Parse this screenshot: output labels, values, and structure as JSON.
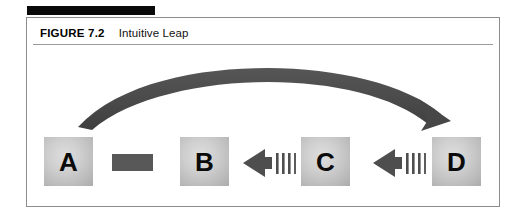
{
  "figure": {
    "label": "FIGURE 7.2",
    "title": "Intuitive Leap"
  },
  "colors": {
    "frame_border": "#8d8d8d",
    "top_rule": "#0a0a0a",
    "caption_rule": "#9a9a9a",
    "node_fill_light": "#dedede",
    "node_fill_dark": "#ababab",
    "node_text": "#0b0b0b",
    "bar_connector": "#585858",
    "arrow_dark": "#4e4e4e",
    "curved_arrow": "#4a4a4a"
  },
  "diagram": {
    "type": "flow",
    "nodes": [
      {
        "id": "A",
        "label": "A"
      },
      {
        "id": "B",
        "label": "B"
      },
      {
        "id": "C",
        "label": "C"
      },
      {
        "id": "D",
        "label": "D"
      }
    ],
    "connectors": [
      {
        "id": "a-b-bar",
        "kind": "solid-bar",
        "from": "A",
        "to": "B",
        "direction": "none"
      },
      {
        "id": "c-to-b",
        "kind": "dashed-arrow",
        "from": "C",
        "to": "B",
        "direction": "left",
        "tail_dashes": 4
      },
      {
        "id": "d-to-c",
        "kind": "dashed-arrow",
        "from": "D",
        "to": "C",
        "direction": "left",
        "tail_dashes": 4
      },
      {
        "id": "a-to-d-leap",
        "kind": "curved-arrow",
        "from": "A",
        "to": "D",
        "direction": "right"
      }
    ]
  }
}
